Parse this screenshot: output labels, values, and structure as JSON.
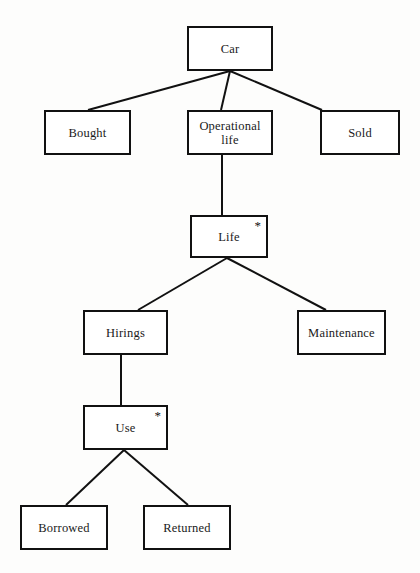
{
  "diagram": {
    "type": "jackson-structure-diagram",
    "iteration_marker": "*",
    "line_color": "#111111",
    "box_border_color": "#111111",
    "box_fill_color": "#ffffff",
    "background_color": "#fdfdfc",
    "nodes": [
      {
        "id": "car",
        "label": "Car",
        "x": 187,
        "y": 26,
        "w": 86,
        "h": 45,
        "iteration": false
      },
      {
        "id": "bought",
        "label": "Bought",
        "x": 44,
        "y": 110,
        "w": 87,
        "h": 45,
        "iteration": false
      },
      {
        "id": "operational",
        "label": "Operational\nlife",
        "x": 187,
        "y": 110,
        "w": 86,
        "h": 45,
        "iteration": false
      },
      {
        "id": "sold",
        "label": "Sold",
        "x": 320,
        "y": 110,
        "w": 80,
        "h": 45,
        "iteration": false
      },
      {
        "id": "life",
        "label": "Life",
        "x": 190,
        "y": 215,
        "w": 78,
        "h": 43,
        "iteration": true
      },
      {
        "id": "hirings",
        "label": "Hirings",
        "x": 83,
        "y": 310,
        "w": 85,
        "h": 45,
        "iteration": false
      },
      {
        "id": "maintenance",
        "label": "Maintenance",
        "x": 297,
        "y": 310,
        "w": 89,
        "h": 45,
        "iteration": false
      },
      {
        "id": "use",
        "label": "Use",
        "x": 83,
        "y": 405,
        "w": 85,
        "h": 45,
        "iteration": true
      },
      {
        "id": "borrowed",
        "label": "Borrowed",
        "x": 20,
        "y": 505,
        "w": 88,
        "h": 45,
        "iteration": false
      },
      {
        "id": "returned",
        "label": "Returned",
        "x": 143,
        "y": 505,
        "w": 88,
        "h": 45,
        "iteration": false
      }
    ],
    "edges": [
      {
        "id": "car-bought",
        "from": "car",
        "to": "bought",
        "x1": 230,
        "y1": 71,
        "x2": 88,
        "y2": 110
      },
      {
        "id": "car-operational",
        "from": "car",
        "to": "operational",
        "x1": 230,
        "y1": 71,
        "x2": 221,
        "y2": 110
      },
      {
        "id": "car-sold",
        "from": "car",
        "to": "sold",
        "x1": 230,
        "y1": 71,
        "x2": 322,
        "y2": 110
      },
      {
        "id": "operational-life",
        "from": "operational",
        "to": "life",
        "x1": 222,
        "y1": 155,
        "x2": 222,
        "y2": 215
      },
      {
        "id": "life-hirings",
        "from": "life",
        "to": "hirings",
        "x1": 227,
        "y1": 258,
        "x2": 138,
        "y2": 310
      },
      {
        "id": "life-maintenance",
        "from": "life",
        "to": "maintenance",
        "x1": 227,
        "y1": 258,
        "x2": 326,
        "y2": 310
      },
      {
        "id": "hirings-use",
        "from": "hirings",
        "to": "use",
        "x1": 121,
        "y1": 355,
        "x2": 121,
        "y2": 405
      },
      {
        "id": "use-borrowed",
        "from": "use",
        "to": "borrowed",
        "x1": 124,
        "y1": 450,
        "x2": 66,
        "y2": 505
      },
      {
        "id": "use-returned",
        "from": "use",
        "to": "returned",
        "x1": 124,
        "y1": 450,
        "x2": 188,
        "y2": 505
      }
    ]
  }
}
